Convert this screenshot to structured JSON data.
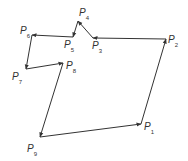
{
  "diagram": {
    "title": "",
    "type": "directed closed polygon",
    "line_color": "#333333",
    "points": [
      {
        "name": "P",
        "sub": "1",
        "x": 141,
        "y": 124,
        "lx": 144,
        "ly": 122
      },
      {
        "name": "P",
        "sub": "2",
        "x": 166,
        "y": 39,
        "lx": 168,
        "ly": 35
      },
      {
        "name": "P",
        "sub": "3",
        "x": 93,
        "y": 38,
        "lx": 92,
        "ly": 41
      },
      {
        "name": "P",
        "sub": "4",
        "x": 78,
        "y": 21,
        "lx": 79,
        "ly": 8
      },
      {
        "name": "P",
        "sub": "5",
        "x": 73,
        "y": 37,
        "lx": 64,
        "ly": 40
      },
      {
        "name": "P",
        "sub": "6",
        "x": 32,
        "y": 35,
        "lx": 20,
        "ly": 26
      },
      {
        "name": "P",
        "sub": "7",
        "x": 26,
        "y": 69,
        "lx": 12,
        "ly": 72
      },
      {
        "name": "P",
        "sub": "8",
        "x": 63,
        "y": 63,
        "lx": 66,
        "ly": 61
      },
      {
        "name": "P",
        "sub": "9",
        "x": 40,
        "y": 137,
        "lx": 27,
        "ly": 144
      }
    ],
    "edges": [
      {
        "from": 0,
        "to": 1
      },
      {
        "from": 1,
        "to": 2
      },
      {
        "from": 2,
        "to": 3
      },
      {
        "from": 3,
        "to": 4
      },
      {
        "from": 4,
        "to": 5
      },
      {
        "from": 5,
        "to": 6
      },
      {
        "from": 6,
        "to": 7
      },
      {
        "from": 7,
        "to": 8
      },
      {
        "from": 8,
        "to": 0
      }
    ]
  }
}
